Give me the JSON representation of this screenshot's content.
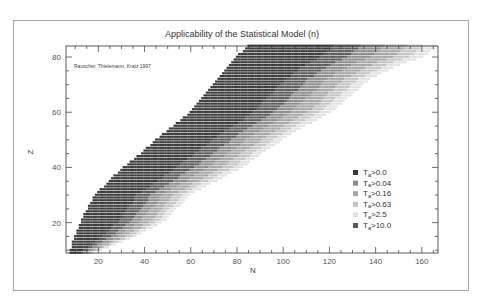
{
  "chart_data": {
    "type": "heatmap",
    "title": "Applicability of the Statistical Model (n)",
    "xlabel": "N",
    "ylabel": "Z",
    "xlim": [
      6,
      167
    ],
    "ylim": [
      9,
      84
    ],
    "xticks": [
      20,
      40,
      60,
      80,
      100,
      120,
      140,
      160
    ],
    "xminor_step": 5,
    "yticks": [
      20,
      40,
      60,
      80
    ],
    "yminor_step": 5,
    "annotation": "Rauscher, Thielemann, Kratz 1997",
    "legend": {
      "placement": "lower-right",
      "entries": [
        {
          "symbol": "T",
          "sub": "a",
          "label": ">0.0",
          "color": "#3a3a3a"
        },
        {
          "symbol": "T",
          "sub": "a",
          "label": ">0.04",
          "color": "#8c8c8c"
        },
        {
          "symbol": "T",
          "sub": "a",
          "label": ">0.16",
          "color": "#a6a6a6"
        },
        {
          "symbol": "T",
          "sub": "a",
          "label": ">0.63",
          "color": "#c4c4c4"
        },
        {
          "symbol": "T",
          "sub": "a",
          "label": ">2.5",
          "color": "#e2e2e2"
        },
        {
          "symbol": "T",
          "sub": "a",
          "label": ">10.0",
          "color": "#5a5a5a"
        }
      ]
    },
    "boundaries": {
      "description": "Approximate nuclide band: for each Z, N runs from n_min to n_max; categories shade from T>0.0 near n_min toward lighter categories near n_max",
      "z": [
        9,
        15,
        21,
        30,
        40,
        46,
        52,
        60,
        64,
        72,
        77,
        80,
        84
      ],
      "n_min": [
        8,
        10,
        13,
        19,
        31,
        40,
        48,
        60,
        64,
        72,
        77,
        80,
        85
      ],
      "n_max": [
        18,
        36,
        49,
        59,
        82,
        92,
        103,
        120,
        126,
        137,
        150,
        160,
        166
      ]
    },
    "category_fractions": [
      0.0,
      0.45,
      0.6,
      0.72,
      0.84,
      0.93
    ]
  }
}
